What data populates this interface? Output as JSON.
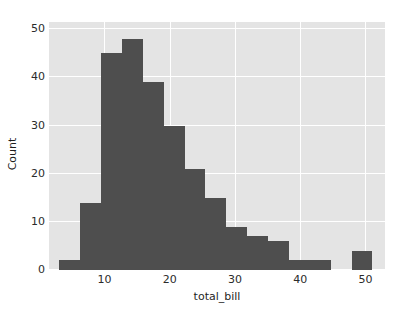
{
  "chart_data": {
    "type": "bar",
    "title": "",
    "subtitle": "",
    "xlabel": "total_bill",
    "ylabel": "Count",
    "xlim": [
      1.5,
      53.0
    ],
    "ylim": [
      0,
      51.5
    ],
    "xticks": [
      10,
      20,
      30,
      40,
      50
    ],
    "yticks": [
      0,
      10,
      20,
      30,
      40,
      50
    ],
    "xtick_labels": [
      "10",
      "20",
      "30",
      "40",
      "50"
    ],
    "ytick_labels": [
      "0",
      "10",
      "20",
      "30",
      "40",
      "50"
    ],
    "grid": true,
    "legend": false,
    "legend_position": "none",
    "bin_width": 3.2,
    "bin_edges": [
      3.07,
      6.27,
      9.47,
      12.67,
      15.87,
      19.07,
      22.27,
      25.47,
      28.67,
      31.87,
      35.07,
      38.27,
      41.47,
      44.67,
      47.87,
      51.07
    ],
    "categories": [
      "3.07-6.27",
      "6.27-9.47",
      "9.47-12.67",
      "12.67-15.87",
      "15.87-19.07",
      "19.07-22.27",
      "22.27-25.47",
      "25.47-28.67",
      "28.67-31.87",
      "31.87-35.07",
      "35.07-38.27",
      "38.27-41.47",
      "41.47-44.67",
      "44.67-47.87",
      "47.87-51.07"
    ],
    "values": [
      2,
      14,
      45,
      48,
      39,
      30,
      21,
      15,
      9,
      7,
      6,
      2,
      2,
      0,
      4
    ],
    "series": [
      {
        "name": "Count",
        "values": [
          2,
          14,
          45,
          48,
          39,
          30,
          21,
          15,
          9,
          7,
          6,
          2,
          2,
          0,
          4
        ]
      }
    ],
    "colors": {
      "bar": "#4e4e4e",
      "axes_background": "#e4e4e4",
      "figure_background": "#ffffff",
      "gridline": "#ffffff",
      "tick_text": "#2b2b2b",
      "label_text": "#1f1f1f"
    }
  }
}
